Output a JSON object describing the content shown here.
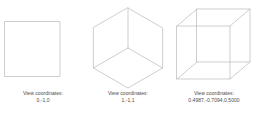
{
  "figure": {
    "caption_label": "View coordinates:",
    "partial_top_text": "",
    "line_color": "#b9b9b9",
    "text_color": "#4a4a4a",
    "background_color": "#ffffff",
    "panels": [
      {
        "id": "square-face-on",
        "shape": "square",
        "caption_label": "View coordinates:",
        "coordinates": "0,-1,0"
      },
      {
        "id": "hexagon-corner-on",
        "shape": "hexagon-with-spokes",
        "caption_label": "View coordinates:",
        "coordinates": "1,-1,1"
      },
      {
        "id": "cube-perspective",
        "shape": "cube-wireframe",
        "caption_label": "View coordinates:",
        "coordinates": "0.4987,-0.7094,0.5000"
      }
    ]
  }
}
